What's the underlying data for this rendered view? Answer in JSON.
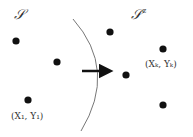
{
  "diagram": {
    "set_label": "𝒮",
    "complement_label": "𝒮ᶜ",
    "complement_sup": "c",
    "point_label_first": "(X₁, Y₁)",
    "point_label_k": "(Xₖ, Yₖ)",
    "colors": {
      "dot": "#111111",
      "boundary": "#777777",
      "arrow": "#111111",
      "text": "#333333"
    },
    "points_left": [
      {
        "x": 16,
        "y": 41
      },
      {
        "x": 57,
        "y": 62
      },
      {
        "x": 28,
        "y": 100
      }
    ],
    "points_right": [
      {
        "x": 110,
        "y": 32
      },
      {
        "x": 163,
        "y": 49
      },
      {
        "x": 126,
        "y": 75
      },
      {
        "x": 163,
        "y": 105
      }
    ]
  }
}
